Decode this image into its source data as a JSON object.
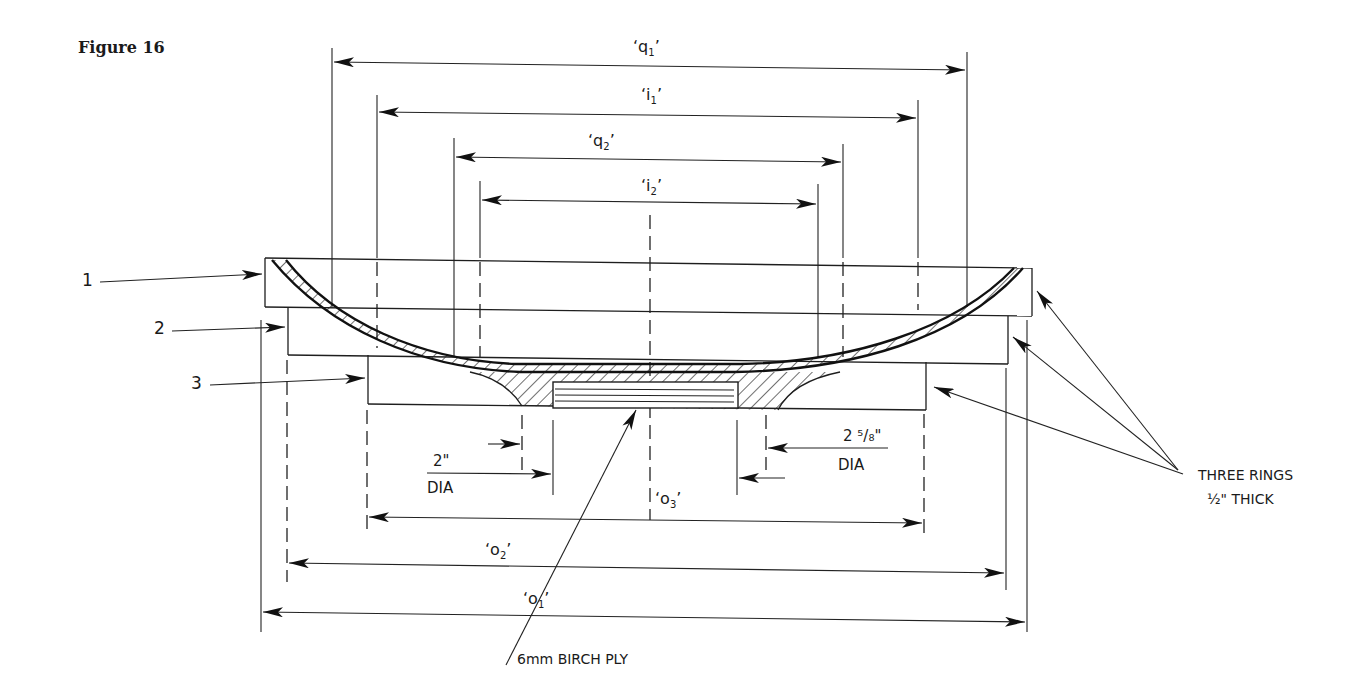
{
  "figure": {
    "title": "Figure 16"
  },
  "dimensions": {
    "q1": {
      "label": "‘q",
      "sub": "1",
      "close": "’"
    },
    "i1": {
      "label": "‘i",
      "sub": "1",
      "close": "’"
    },
    "q2": {
      "label": "‘q",
      "sub": "2",
      "close": "’"
    },
    "i2": {
      "label": "‘i",
      "sub": "2",
      "close": "’"
    },
    "o3": {
      "label": "‘o",
      "sub": "3",
      "close": "’"
    },
    "o2": {
      "label": "‘o",
      "sub": "2",
      "close": "’"
    },
    "o1": {
      "label": "‘o",
      "sub": "1",
      "close": "’"
    }
  },
  "parts": {
    "ring1": "1",
    "ring2": "2",
    "ring3": "3"
  },
  "annotations": {
    "small_dia_value": "2\"",
    "small_dia_unit": "DIA",
    "large_dia_value": "2 ⁵/₈\"",
    "large_dia_unit": "DIA",
    "rings_line1": "THREE RINGS",
    "rings_line2": "½\" THICK",
    "ply": "6mm BIRCH PLY"
  },
  "colors": {
    "ink": "#1e1e1e",
    "paper": "#ffffff"
  }
}
